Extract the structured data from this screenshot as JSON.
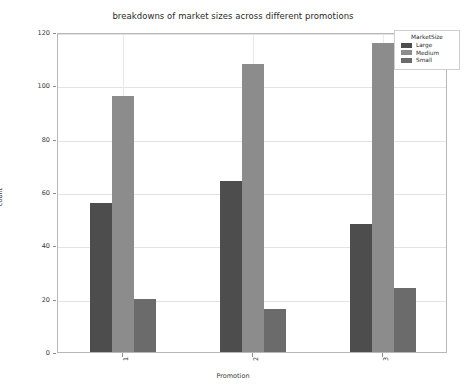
{
  "chart_data": {
    "type": "bar",
    "title": "breakdowns of market sizes across different promotions",
    "xlabel": "Promotion",
    "ylabel": "count",
    "categories": [
      "1",
      "2",
      "3"
    ],
    "series": [
      {
        "name": "Large",
        "color": "#4d4d4d",
        "values": [
          56,
          64,
          48
        ]
      },
      {
        "name": "Medium",
        "color": "#8c8c8c",
        "values": [
          96,
          108,
          116
        ]
      },
      {
        "name": "Small",
        "color": "#6b6b6b",
        "values": [
          20,
          16,
          24
        ]
      }
    ],
    "ylim": [
      0,
      120
    ],
    "yticks": [
      0,
      20,
      40,
      60,
      80,
      100,
      120
    ],
    "ytick_labels": [
      "0",
      "20",
      "40",
      "60",
      "80",
      "100",
      "120"
    ],
    "grid": true,
    "legend_title": "MarketSize",
    "legend_position": "upper right"
  }
}
